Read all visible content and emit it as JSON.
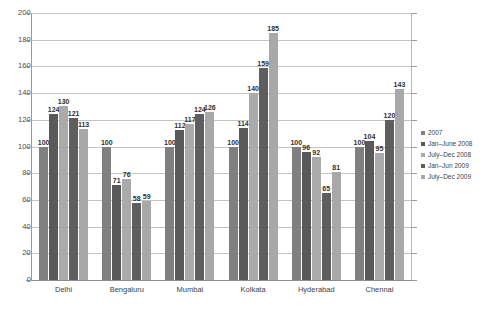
{
  "chart_data": {
    "type": "bar",
    "title": "",
    "xlabel": "",
    "ylabel": "",
    "ylim": [
      0,
      200
    ],
    "ytick_step": 20,
    "yticks": [
      0,
      20,
      40,
      60,
      80,
      100,
      120,
      140,
      160,
      180,
      200
    ],
    "grid": true,
    "legend_position": "right",
    "categories": [
      "Delhi",
      "Bengaluru",
      "Mumbai",
      "Kolkata",
      "Hyderabad",
      "Chennai"
    ],
    "series": [
      {
        "name": "2007",
        "color": "#808080",
        "values": [
          100,
          100,
          100,
          100,
          100,
          100
        ]
      },
      {
        "name": "Jan–June 2008",
        "color": "#595959",
        "values": [
          124,
          71,
          112,
          114,
          96,
          104
        ]
      },
      {
        "name": "July–Dec 2008",
        "color": "#aaaaaa",
        "values": [
          130,
          76,
          117,
          140,
          92,
          95
        ]
      },
      {
        "name": "Jan–Jun 2009",
        "color": "#5e5e5e",
        "values": [
          121,
          58,
          124,
          159,
          65,
          120
        ]
      },
      {
        "name": "July–Dec 2009",
        "color": "#a8a8a8",
        "values": [
          113,
          59,
          126,
          185,
          81,
          143
        ]
      }
    ]
  },
  "legend": {
    "items": [
      {
        "label": "2007",
        "color": "#808080"
      },
      {
        "label": "Jan–June 2008",
        "color": "#595959"
      },
      {
        "label": "July–Dec 2008",
        "color": "#aaaaaa"
      },
      {
        "label": "Jan–Jun 2009",
        "color": "#5e5e5e"
      },
      {
        "label": "July–Dec 2009",
        "color": "#a8a8a8"
      }
    ]
  },
  "footnote": {
    "text": ""
  }
}
